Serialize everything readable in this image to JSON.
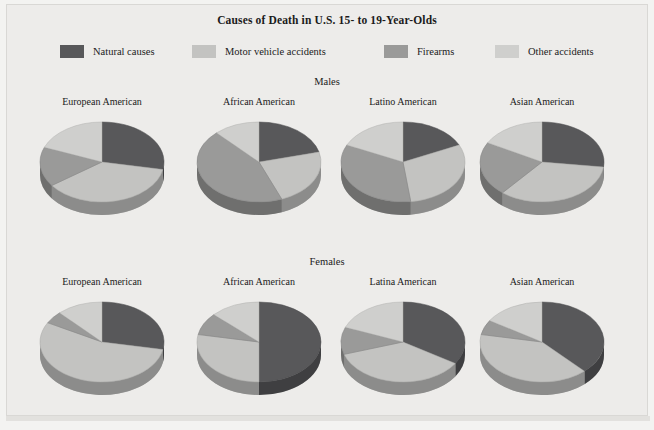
{
  "title": "Causes of Death in U.S. 15- to 19-Year-Olds",
  "legend": {
    "items": [
      {
        "label": "Natural causes",
        "color": "#58585a"
      },
      {
        "label": "Motor vehicle accidents",
        "color": "#c3c3c1"
      },
      {
        "label": "Firearms",
        "color": "#9a9a99"
      },
      {
        "label": "Other accidents",
        "color": "#cfcfcd"
      }
    ]
  },
  "rows": [
    {
      "heading": "Males"
    },
    {
      "heading": "Females"
    }
  ],
  "chart_data": {
    "type": "pie",
    "title": "Causes of Death in U.S. 15- to 19-Year-Olds",
    "categories": [
      "Natural causes",
      "Motor vehicle accidents",
      "Firearms",
      "Other accidents"
    ],
    "colors": [
      "#58585a",
      "#c3c3c1",
      "#9a9a99",
      "#cfcfcd"
    ],
    "legend_position": "top",
    "grid": false,
    "panels": [
      {
        "group": "Males",
        "charts": [
          {
            "label": "European American",
            "values": [
              28,
              37,
              16,
              19
            ]
          },
          {
            "label": "African American",
            "values": [
              21,
              23,
              44,
              12
            ]
          },
          {
            "label": "Latino American",
            "values": [
              18,
              30,
              34,
              18
            ]
          },
          {
            "label": "Asian American",
            "values": [
              27,
              34,
              22,
              17
            ]
          }
        ]
      },
      {
        "group": "Females",
        "charts": [
          {
            "label": "European American",
            "values": [
              28,
              55,
              5,
              12
            ]
          },
          {
            "label": "African American",
            "values": [
              50,
              28,
              9,
              13
            ]
          },
          {
            "label": "Latina American",
            "values": [
              34,
              36,
              11,
              19
            ]
          },
          {
            "label": "Asian American",
            "values": [
              38,
              40,
              6,
              16
            ]
          }
        ]
      }
    ]
  }
}
